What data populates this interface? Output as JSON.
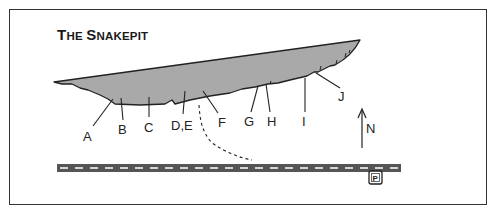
{
  "map": {
    "title": "The Snakepit",
    "title_parts": [
      {
        "text": "T",
        "size": "big"
      },
      {
        "text": "HE ",
        "size": "small"
      },
      {
        "text": "S",
        "size": "big"
      },
      {
        "text": "NAKEPIT",
        "size": "small"
      }
    ],
    "north_label": "N",
    "parking_icon": "parking-icon",
    "parking_glyph": "P",
    "route_labels": [
      "A",
      "B",
      "C",
      "D,E",
      "F",
      "G",
      "H",
      "I",
      "J"
    ],
    "colors": {
      "cliff_fill": "#a9a9a9",
      "road": "#555555",
      "road_dash": "#ffffff",
      "line": "#222222",
      "border": "#333333"
    }
  }
}
